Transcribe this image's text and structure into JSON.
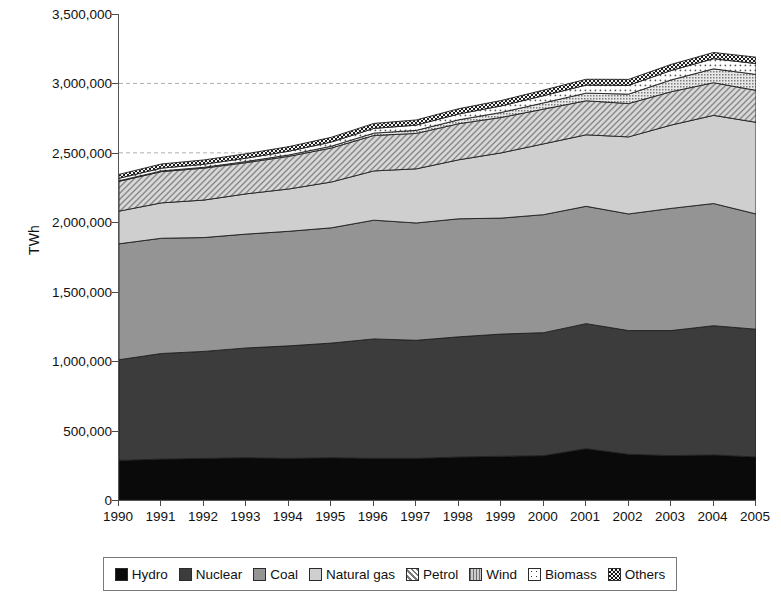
{
  "chart_data": {
    "type": "area",
    "stacked": true,
    "title": "",
    "xlabel": "",
    "ylabel": "TWh",
    "grid": "horizontal-dashed-partial",
    "gridlines": [
      2500000,
      3000000
    ],
    "legend_position": "bottom",
    "xlim": [
      1990,
      2005
    ],
    "ylim": [
      0,
      3500000
    ],
    "ytick_labels": [
      "0",
      "500,000",
      "1,000,000",
      "1,500,000",
      "2,000,000",
      "2,500,000",
      "3,000,000",
      "3,500,000"
    ],
    "yticks": [
      0,
      500000,
      1000000,
      1500000,
      2000000,
      2500000,
      3000000,
      3500000
    ],
    "categories": [
      1990,
      1991,
      1992,
      1993,
      1994,
      1995,
      1996,
      1997,
      1998,
      1999,
      2000,
      2001,
      2002,
      2003,
      2004,
      2005
    ],
    "xtick_labels": [
      "1990",
      "1991",
      "1992",
      "1993",
      "1994",
      "1995",
      "1996",
      "1997",
      "1998",
      "1999",
      "2000",
      "2001",
      "2002",
      "2003",
      "2004",
      "2005"
    ],
    "series": [
      {
        "name": "Hydro",
        "fill": "#0a0a0a",
        "pattern": "solid",
        "values": [
          285000,
          295000,
          300000,
          305000,
          300000,
          305000,
          300000,
          300000,
          310000,
          315000,
          320000,
          370000,
          330000,
          320000,
          325000,
          310000
        ]
      },
      {
        "name": "Nuclear",
        "fill": "#3c3c3c",
        "pattern": "solid",
        "values": [
          725000,
          760000,
          770000,
          790000,
          810000,
          825000,
          860000,
          850000,
          865000,
          880000,
          885000,
          900000,
          890000,
          900000,
          930000,
          920000
        ]
      },
      {
        "name": "Coal",
        "fill": "#949494",
        "pattern": "solid",
        "values": [
          835000,
          830000,
          820000,
          820000,
          825000,
          830000,
          855000,
          845000,
          850000,
          835000,
          850000,
          845000,
          840000,
          880000,
          880000,
          830000
        ]
      },
      {
        "name": "Natural gas",
        "fill": "#cfcfcf",
        "pattern": "solid",
        "values": [
          235000,
          255000,
          270000,
          290000,
          305000,
          330000,
          355000,
          390000,
          425000,
          470000,
          510000,
          515000,
          555000,
          600000,
          635000,
          660000
        ]
      },
      {
        "name": "Petrol",
        "fill": "#d8d8d8",
        "pattern": "diagonal-hatch",
        "values": [
          215000,
          225000,
          230000,
          225000,
          235000,
          245000,
          255000,
          255000,
          260000,
          255000,
          250000,
          245000,
          240000,
          240000,
          235000,
          230000
        ]
      },
      {
        "name": "Wind",
        "fill": "#b8b8b8",
        "pattern": "fine-dots",
        "values": [
          4000,
          5000,
          6000,
          8000,
          10000,
          13000,
          17000,
          22000,
          28000,
          36000,
          45000,
          55000,
          68000,
          85000,
          100000,
          115000
        ]
      },
      {
        "name": "Biomass",
        "fill": "#fbfbfb",
        "pattern": "sparse-dots",
        "values": [
          18000,
          20000,
          22000,
          24000,
          27000,
          30000,
          34000,
          38000,
          42000,
          47000,
          52000,
          58000,
          63000,
          68000,
          73000,
          78000
        ]
      },
      {
        "name": "Others",
        "fill": "#2a2a2a",
        "pattern": "checker",
        "values": [
          28000,
          30000,
          31000,
          32000,
          33000,
          34000,
          36000,
          37000,
          38000,
          39000,
          40000,
          42000,
          43000,
          44000,
          45000,
          46000
        ]
      }
    ],
    "stack_tops": {
      "Hydro": [
        285000,
        295000,
        300000,
        305000,
        300000,
        305000,
        300000,
        300000,
        310000,
        315000,
        320000,
        370000,
        330000,
        320000,
        325000,
        310000
      ],
      "Nuclear": [
        1010000,
        1055000,
        1070000,
        1095000,
        1110000,
        1130000,
        1160000,
        1150000,
        1175000,
        1195000,
        1205000,
        1270000,
        1220000,
        1220000,
        1255000,
        1230000
      ],
      "Coal": [
        1845000,
        1885000,
        1890000,
        1915000,
        1935000,
        1960000,
        2015000,
        1995000,
        2025000,
        2030000,
        2055000,
        2115000,
        2060000,
        2100000,
        2135000,
        2060000
      ],
      "Natural gas": [
        2080000,
        2140000,
        2160000,
        2205000,
        2240000,
        2290000,
        2370000,
        2385000,
        2450000,
        2500000,
        2565000,
        2630000,
        2615000,
        2700000,
        2770000,
        2720000
      ],
      "Petrol": [
        2295000,
        2365000,
        2390000,
        2430000,
        2475000,
        2535000,
        2625000,
        2640000,
        2710000,
        2755000,
        2815000,
        2875000,
        2855000,
        2940000,
        3005000,
        2950000
      ],
      "Wind": [
        2299000,
        2370000,
        2396000,
        2438000,
        2485000,
        2548000,
        2642000,
        2662000,
        2738000,
        2791000,
        2860000,
        2930000,
        2923000,
        3025000,
        3105000,
        3065000
      ],
      "Biomass": [
        2317000,
        2390000,
        2418000,
        2462000,
        2512000,
        2578000,
        2676000,
        2700000,
        2780000,
        2838000,
        2912000,
        2988000,
        2986000,
        3093000,
        3178000,
        3143000
      ],
      "Others": [
        2345000,
        2420000,
        2449000,
        2494000,
        2545000,
        2612000,
        2712000,
        2737000,
        2818000,
        2877000,
        2952000,
        3030000,
        3029000,
        3137000,
        3223000,
        3189000
      ]
    }
  },
  "axis": {
    "ylabel": "TWh"
  },
  "legend": {
    "items": [
      {
        "label": "Hydro"
      },
      {
        "label": "Nuclear"
      },
      {
        "label": "Coal"
      },
      {
        "label": "Natural gas"
      },
      {
        "label": "Petrol"
      },
      {
        "label": "Wind"
      },
      {
        "label": "Biomass"
      },
      {
        "label": "Others"
      }
    ]
  },
  "colors": {
    "hydro": "#0a0a0a",
    "nuclear": "#3c3c3c",
    "coal": "#949494",
    "natural_gas": "#cfcfcf",
    "petrol": "#d8d8d8",
    "wind": "#b8b8b8",
    "biomass": "#fbfbfb",
    "others": "#2a2a2a",
    "axis": "#555555",
    "gridline": "#b0b0b0"
  }
}
